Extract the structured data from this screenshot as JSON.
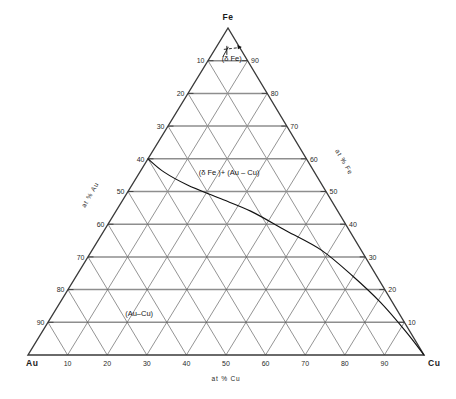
{
  "diagram": {
    "type": "ternary-phase-diagram",
    "system": "Au-Cu-Fe",
    "vertices": {
      "top": "Fe",
      "bottom_left": "Au",
      "bottom_right": "Cu"
    },
    "axes": {
      "bottom": {
        "label": "at % Cu",
        "ticks": [
          "10",
          "20",
          "30",
          "40",
          "50",
          "60",
          "70",
          "80",
          "90"
        ]
      },
      "left": {
        "label": "at % Au",
        "ticks": [
          "10",
          "20",
          "30",
          "40",
          "50",
          "60",
          "70",
          "80",
          "90"
        ]
      },
      "right": {
        "label": "at % Fe",
        "ticks": [
          "10",
          "20",
          "30",
          "40",
          "50",
          "60",
          "70",
          "80",
          "90"
        ]
      }
    },
    "phase_fields": [
      {
        "name": "delta-iron",
        "label": "(δ Fe)"
      },
      {
        "name": "two-phase",
        "label": "(δ Fe )+ (Au – Cu)"
      },
      {
        "name": "gold-copper",
        "label": "(Au–Cu)"
      }
    ],
    "colors": {
      "outline": "#3a3a3a",
      "grid_horizontal": "#8e8e8e",
      "grid_diagonal": "#5a5a5a",
      "boundary": "#111111",
      "text": "#1a1a1a",
      "background": "#ffffff"
    },
    "grid": {
      "interval": 10,
      "show": true
    }
  },
  "chart_data": {
    "type": "scatter",
    "title": "",
    "xlabel": "at % Cu",
    "ylabel": "at % Au",
    "ternary_components": [
      "Fe",
      "Au",
      "Cu"
    ],
    "grid": true,
    "legend": "none",
    "axis_ranges": {
      "Fe": [
        0,
        100
      ],
      "Au": [
        0,
        100
      ],
      "Cu": [
        0,
        100
      ]
    },
    "tick_interval": 10,
    "series": [
      {
        "name": "(δFe)/(δFe)+(Au–Cu) phase boundary",
        "kind": "curve",
        "points_ternary": [
          {
            "Au": 40,
            "Cu": 0,
            "Fe": 60
          },
          {
            "Au": 38,
            "Cu": 6,
            "Fe": 56
          },
          {
            "Au": 34,
            "Cu": 14,
            "Fe": 52
          },
          {
            "Au": 28,
            "Cu": 24,
            "Fe": 48
          },
          {
            "Au": 22,
            "Cu": 34,
            "Fe": 44
          },
          {
            "Au": 16,
            "Cu": 46,
            "Fe": 38
          },
          {
            "Au": 10,
            "Cu": 58,
            "Fe": 32
          },
          {
            "Au": 6,
            "Cu": 70,
            "Fe": 24
          },
          {
            "Au": 3,
            "Cu": 81,
            "Fe": 16
          },
          {
            "Au": 1,
            "Cu": 92,
            "Fe": 7
          },
          {
            "Au": 0,
            "Cu": 100,
            "Fe": 0
          }
        ]
      },
      {
        "name": "(δFe) single phase boundary near Fe apex",
        "kind": "marker",
        "points_ternary": [
          {
            "Au": 3,
            "Cu": 4,
            "Fe": 93
          }
        ]
      }
    ],
    "annotations": [
      {
        "text": "(δ Fe)",
        "Au": 4,
        "Cu": 6,
        "Fe": 90
      },
      {
        "text": "(δ Fe )+ (Au – Cu)",
        "Au": 22,
        "Cu": 23,
        "Fe": 55
      },
      {
        "text": "(Au–Cu)",
        "Au": 66,
        "Cu": 22,
        "Fe": 12
      }
    ]
  }
}
